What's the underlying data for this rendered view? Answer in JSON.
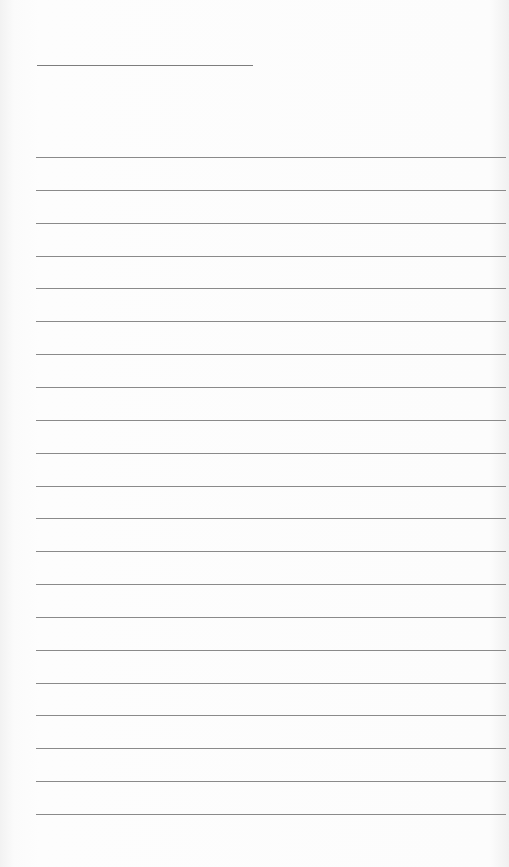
{
  "document": {
    "type": "lined paper",
    "header_line": {
      "x": 37,
      "y": 65,
      "width": 216
    },
    "ruled_lines": {
      "count": 21,
      "first_y": 157,
      "spacing": 32.85,
      "left": 36,
      "color": "#8a8a8a"
    },
    "background_color": "#fcfcfc"
  }
}
